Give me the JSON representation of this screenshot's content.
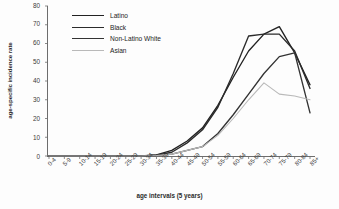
{
  "chart_data": {
    "type": "line",
    "title": "",
    "xlabel": "age intervals (5 years)",
    "ylabel": "age-specific incidence rate",
    "categories": [
      "0-4",
      "5-9",
      "10-14",
      "15-19",
      "20-24",
      "25-29",
      "30-34",
      "35-39",
      "40-44",
      "45-49",
      "50-54",
      "55-59",
      "60-64",
      "65-69",
      "70-74",
      "75-79",
      "80-84",
      "85+"
    ],
    "ylim": [
      0,
      80
    ],
    "yticks": [
      0,
      10,
      20,
      30,
      40,
      50,
      60,
      70,
      80
    ],
    "grid": false,
    "legend_position": "top-left",
    "series": [
      {
        "name": "Latino",
        "color": "#222222",
        "values": [
          0,
          0,
          0,
          0,
          0,
          0,
          0,
          0.6,
          3,
          8,
          15,
          27,
          42,
          56,
          65,
          69,
          55,
          38
        ]
      },
      {
        "name": "Black",
        "color": "#2b2b2b",
        "values": [
          0,
          0,
          0,
          0,
          0,
          0,
          0,
          0.5,
          2,
          7,
          14,
          26,
          44,
          64,
          65,
          65,
          56,
          36
        ]
      },
      {
        "name": "Non-Latino White",
        "color": "#333333",
        "values": [
          0,
          0,
          0,
          0,
          0,
          0,
          0,
          0.4,
          1,
          3,
          5,
          12,
          22,
          33,
          44,
          53,
          55,
          23
        ]
      },
      {
        "name": "Asian",
        "color": "#b9b9b9",
        "values": [
          0,
          0,
          0,
          0,
          0,
          0,
          0,
          0.3,
          1,
          3,
          5,
          11,
          20,
          30,
          39,
          33,
          32,
          30
        ]
      }
    ]
  }
}
